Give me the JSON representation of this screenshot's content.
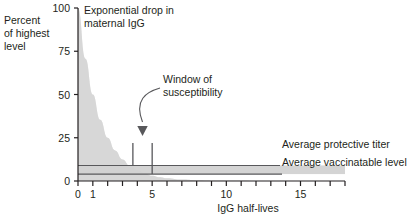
{
  "chart_data": {
    "type": "area",
    "title": "Exponential drop in maternal IgG",
    "xlabel": "IgG half-lives",
    "ylabel": "Percent of highest level",
    "ylabel_lines": [
      "Percent",
      "of highest",
      "level"
    ],
    "xlim": [
      0,
      18
    ],
    "ylim": [
      0,
      100
    ],
    "grid": false,
    "legend_position": "right-inline",
    "y_ticks": [
      0,
      25,
      50,
      75,
      100
    ],
    "y_tick_labels": [
      "0",
      "25",
      "50",
      "75",
      "100"
    ],
    "x_ticks": [
      0,
      1,
      2,
      3,
      4,
      5,
      6,
      7,
      8,
      9,
      10,
      11,
      12,
      13,
      14,
      15,
      16,
      17,
      18
    ],
    "x_tick_labels_shown": [
      {
        "value": 0,
        "label": "0"
      },
      {
        "value": 1,
        "label": "1"
      },
      {
        "value": 5,
        "label": "5"
      },
      {
        "value": 10,
        "label": "10"
      },
      {
        "value": 15,
        "label": "15"
      }
    ],
    "series": [
      {
        "name": "Maternal IgG decay",
        "type": "area",
        "fill_color": "#e0e0e0",
        "x": [
          0,
          0.5,
          1,
          1.5,
          2,
          2.5,
          3,
          3.5,
          4,
          4.5,
          5,
          5.5,
          6,
          7,
          8,
          9,
          10,
          12,
          14,
          16,
          18
        ],
        "values": [
          100,
          70.7,
          50,
          35.4,
          25,
          17.7,
          12.5,
          8.8,
          6.25,
          4.4,
          3.1,
          2.2,
          1.6,
          0.8,
          0.4,
          0.2,
          0.1,
          0.02,
          0.006,
          0.0015,
          0.0004
        ]
      }
    ],
    "threshold_lines": [
      {
        "name": "Average protective titer",
        "label": "Average protective titer",
        "y": 9,
        "color": "#58585b"
      },
      {
        "name": "Average vaccinatable level",
        "label": "Average vaccinatable level",
        "y": 4,
        "color": "#58585b"
      }
    ],
    "band": {
      "name": "susceptibility-band",
      "y_low": 4,
      "y_high": 9,
      "color": "#d4d4d4"
    },
    "annotations": [
      {
        "name": "window-of-susceptibility",
        "text": "Window of susceptibility",
        "text_lines": [
          "Window of",
          "susceptibility"
        ],
        "arrow": true,
        "x_range": [
          3.7,
          5.0
        ]
      },
      {
        "name": "chart-title-annotation",
        "text": "Exponential drop in maternal IgG",
        "text_lines": [
          "Exponential drop in",
          "maternal IgG"
        ],
        "arrow": false
      }
    ],
    "window_markers": [
      {
        "name": "window-start-marker",
        "x": 3.7,
        "y_top": 22,
        "y_bottom": 9
      },
      {
        "name": "window-end-marker",
        "x": 5.0,
        "y_top": 22,
        "y_bottom": 4
      }
    ]
  }
}
